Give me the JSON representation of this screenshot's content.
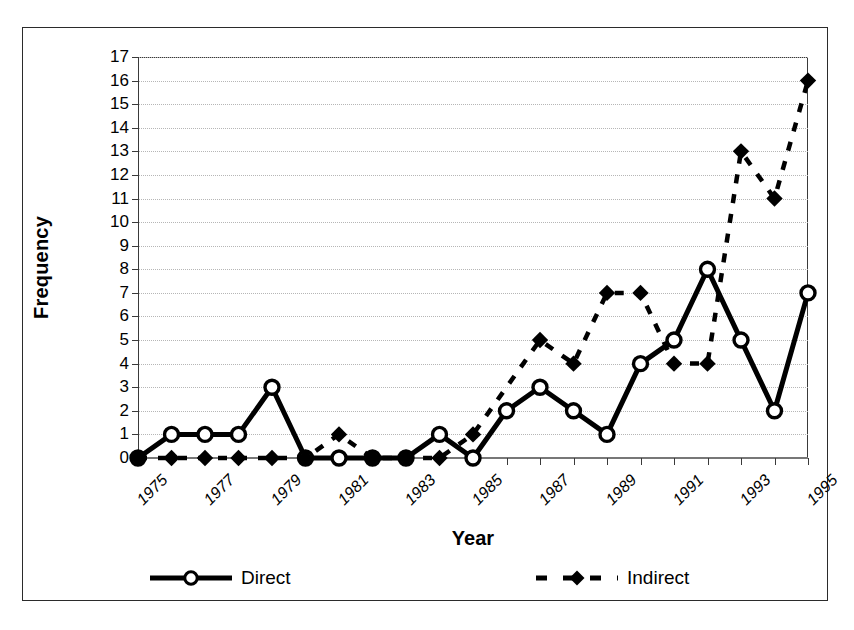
{
  "chart_data": {
    "type": "line",
    "title": "",
    "xlabel": "Year",
    "ylabel": "Frequency",
    "ylim": [
      0,
      17
    ],
    "yticks": [
      0,
      1,
      2,
      3,
      4,
      5,
      6,
      7,
      8,
      9,
      10,
      11,
      12,
      13,
      14,
      15,
      16,
      17
    ],
    "grid": true,
    "legend_position": "bottom",
    "x": [
      1976,
      1977,
      1978,
      1979,
      1980,
      1981,
      1982,
      1983,
      1984,
      1985,
      1986,
      1987,
      1988,
      1989,
      1990,
      1991,
      1992,
      1993,
      1994,
      1995,
      1996
    ],
    "xtick_labels": [
      "1975",
      "1977",
      "1979",
      "1981",
      "1983",
      "1985",
      "1987",
      "1989",
      "1991",
      "1993",
      "1995"
    ],
    "xtick_values": [
      1975,
      1977,
      1979,
      1981,
      1983,
      1985,
      1987,
      1989,
      1991,
      1993,
      1995
    ],
    "series": [
      {
        "name": "Direct",
        "marker": "open-circle",
        "linestyle": "solid",
        "color": "#000000",
        "values": [
          0,
          1,
          1,
          1,
          3,
          0,
          0,
          0,
          0,
          1,
          0,
          2,
          3,
          2,
          1,
          4,
          5,
          8,
          5,
          2,
          7
        ]
      },
      {
        "name": "Indirect",
        "marker": "filled-diamond",
        "linestyle": "dashed",
        "color": "#000000",
        "values": [
          0,
          0,
          0,
          0,
          0,
          0,
          1,
          0,
          0,
          0,
          1,
          null,
          5,
          4,
          7,
          7,
          4,
          4,
          13,
          11,
          16
        ]
      }
    ]
  },
  "axes": {
    "y_title": "Frequency",
    "x_title": "Year"
  },
  "legend": {
    "items": [
      {
        "label": "Direct",
        "marker": "open-circle",
        "linestyle": "solid"
      },
      {
        "label": "Indirect",
        "marker": "filled-diamond",
        "linestyle": "dashed"
      }
    ]
  }
}
